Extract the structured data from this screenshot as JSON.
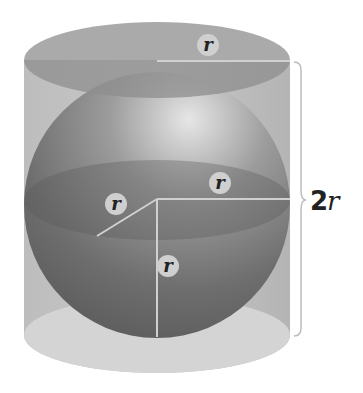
{
  "figure": {
    "labels": {
      "top_radius": "r",
      "equator_radius": "r",
      "depth_radius": "r",
      "vertical_radius": "r",
      "height_number": "2",
      "height_var": "r"
    },
    "colors": {
      "cylinder": "#b9b9b9",
      "cylinder_top": "#9a9a9a",
      "sphere_dark": "#6a6a6a",
      "sphere_light": "#d8d8d8",
      "guide_line": "#d0d0d0",
      "label_bg": "#cfcfcf"
    }
  }
}
